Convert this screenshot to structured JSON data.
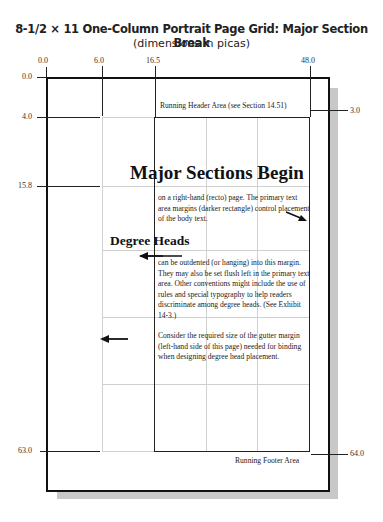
{
  "header": {
    "title": "8-1/2 × 11 One-Column Portrait Page Grid: Major Section Break",
    "subtitle": "(dimensions in picas)"
  },
  "rulers": {
    "top": [
      {
        "label": "0.0",
        "x": 46
      },
      {
        "label": "6.0",
        "x": 102
      },
      {
        "label": "16.5",
        "x": 155
      },
      {
        "label": "48.0",
        "x": 310
      }
    ],
    "left": [
      {
        "label": "0.0",
        "y": 77
      },
      {
        "label": "4.0",
        "y": 117
      },
      {
        "label": "15.8",
        "y": 186
      },
      {
        "label": "63.0",
        "y": 451
      }
    ],
    "right": [
      {
        "label": "3.0",
        "y": 110
      },
      {
        "label": "64.0",
        "y": 454
      }
    ]
  },
  "page": {
    "running_header": "Running Header Area (see Section 14.51)",
    "running_footer": "Running Footer Area",
    "major_heading": "Major Sections Begin",
    "degree_heading": "Degree Heads",
    "paragraphs": [
      "on a right-hand (recto) page.  The primary text area margins (darker rectangle) control placement of the body text.",
      "can be outdented (or hanging) into this margin.  They may also be set flush left in the primary text area.  Other conventions might include the use of rules and special typography to help readers discriminate among degree heads.  (See Exhibit 14-3.)",
      "Consider the required size of the gutter margin (left-hand side of this page) needed for binding when designing degree head placement."
    ]
  },
  "colors": {
    "frame": "#111111",
    "grid": "#d0d0d0",
    "shadow": "#c8c8c8"
  }
}
